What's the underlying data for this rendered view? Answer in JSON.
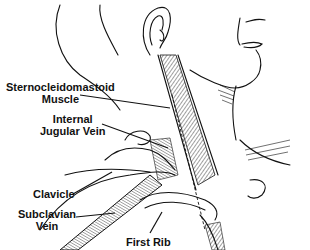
{
  "diagram": {
    "labels": [
      {
        "id": "scm",
        "lines": [
          "Sternocleidomastoid",
          "Muscle"
        ]
      },
      {
        "id": "ijv",
        "lines": [
          "Internal",
          "Jugular Vein"
        ]
      },
      {
        "id": "clavicle",
        "lines": [
          "Clavicle"
        ]
      },
      {
        "id": "subclavian",
        "lines": [
          "Subclavian",
          "Vein"
        ]
      },
      {
        "id": "rib",
        "lines": [
          "First Rib"
        ]
      }
    ]
  }
}
